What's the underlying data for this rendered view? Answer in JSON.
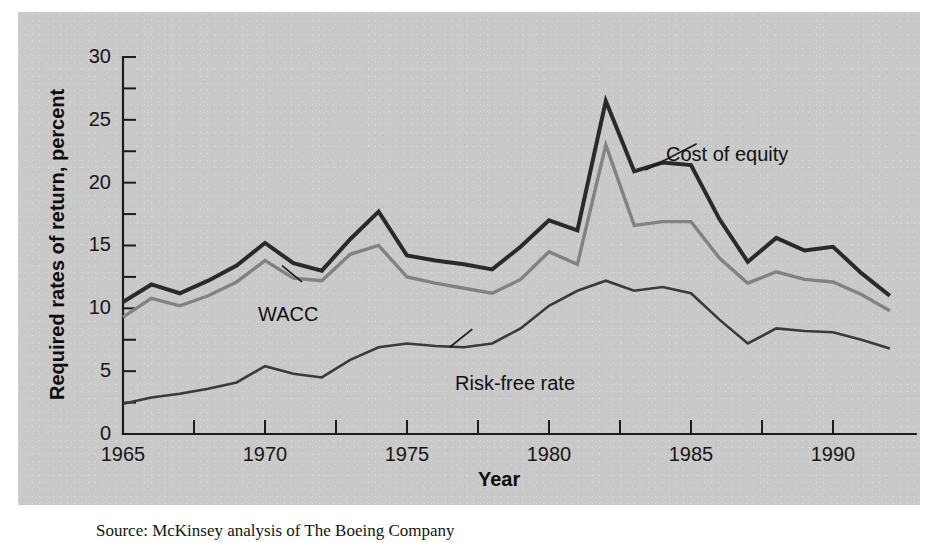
{
  "figure": {
    "background_color": "#c9c9c9",
    "page_color": "#ffffff",
    "caption": "Source: McKinsey analysis of The Boeing Company"
  },
  "axes": {
    "y_title": "Required rates of return, percent",
    "x_title": "Year",
    "y_tick_labels": [
      "0",
      "5",
      "10",
      "15",
      "20",
      "25",
      "30"
    ],
    "x_tick_labels": [
      "1965",
      "1970",
      "1975",
      "1980",
      "1985",
      "1990"
    ]
  },
  "annotations": {
    "cost_of_equity": "Cost of equity",
    "wacc": "WACC",
    "risk_free_rate": "Risk-free rate"
  },
  "chart_data": {
    "type": "line",
    "title": "",
    "subtitle": "",
    "xlabel": "Year",
    "ylabel": "Required rates of return, percent",
    "xlim": [
      1965,
      1992
    ],
    "ylim": [
      0,
      30
    ],
    "ytick_step": 5,
    "yminor_step": 2.5,
    "xtick_step": 5,
    "xminor_step": 1,
    "grid": false,
    "legend": "inline-annotations",
    "x": [
      1965,
      1966,
      1967,
      1968,
      1969,
      1970,
      1971,
      1972,
      1973,
      1974,
      1975,
      1976,
      1977,
      1978,
      1979,
      1980,
      1981,
      1982,
      1983,
      1984,
      1985,
      1986,
      1987,
      1988,
      1989,
      1990,
      1991,
      1992
    ],
    "series": [
      {
        "name": "Cost of equity",
        "color": "#2a2a2a",
        "width": 4.0,
        "values": [
          10.5,
          11.9,
          11.2,
          12.2,
          13.4,
          15.2,
          13.6,
          13.0,
          15.5,
          17.7,
          14.2,
          13.8,
          13.5,
          13.1,
          14.9,
          17.0,
          16.2,
          26.5,
          20.9,
          21.6,
          21.4,
          17.1,
          13.7,
          15.6,
          14.6,
          14.9,
          12.8,
          11.0
        ]
      },
      {
        "name": "WACC",
        "color": "#828282",
        "width": 3.4,
        "values": [
          9.3,
          10.8,
          10.2,
          11.0,
          12.1,
          13.8,
          12.4,
          12.2,
          14.3,
          15.0,
          12.5,
          12.0,
          11.6,
          11.2,
          12.3,
          14.5,
          13.5,
          23.0,
          16.6,
          16.9,
          16.9,
          14.0,
          12.0,
          12.9,
          12.3,
          12.1,
          11.1,
          9.8
        ]
      },
      {
        "name": "Risk-free rate",
        "color": "#3a3a3a",
        "width": 2.6,
        "values": [
          2.4,
          2.9,
          3.2,
          3.6,
          4.1,
          5.4,
          4.8,
          4.5,
          5.9,
          6.9,
          7.2,
          7.0,
          6.9,
          7.2,
          8.4,
          10.2,
          11.4,
          12.2,
          11.4,
          11.7,
          11.2,
          9.1,
          7.2,
          8.4,
          8.2,
          8.1,
          7.5,
          6.8
        ]
      }
    ]
  },
  "plot_geometry": {
    "x_px_1965": 123,
    "x_px_per_year": 28.4,
    "y_px_zero": 434,
    "y_px_per_unit": 12.567
  }
}
